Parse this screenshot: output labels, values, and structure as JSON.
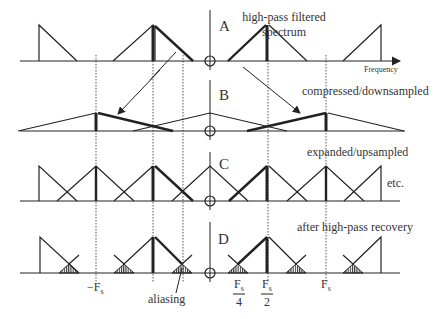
{
  "panels": [
    {
      "id": "A",
      "label": "A",
      "caption": [
        "high-pass filtered",
        "spectrum"
      ]
    },
    {
      "id": "B",
      "label": "B",
      "caption": [
        "compressed/downsampled"
      ]
    },
    {
      "id": "C",
      "label": "C",
      "caption": [
        "expanded/upsampled"
      ],
      "note": "etc."
    },
    {
      "id": "D",
      "label": "D",
      "caption": [
        "after high-pass recovery"
      ],
      "annotation": "aliasing"
    }
  ],
  "axis": {
    "x_label": "Frequency"
  },
  "ticks": {
    "neg_fs": {
      "main": "−F",
      "sub": "s"
    },
    "fs_over_4": {
      "num_main": "F",
      "num_sub": "s",
      "den": "4"
    },
    "fs_over_2": {
      "num_main": "F",
      "num_sub": "s",
      "den": "2"
    },
    "fs": {
      "main": "F",
      "sub": "s"
    }
  },
  "colors": {
    "line": "#222222",
    "dotted": "#555555",
    "hatch": "#333333"
  }
}
